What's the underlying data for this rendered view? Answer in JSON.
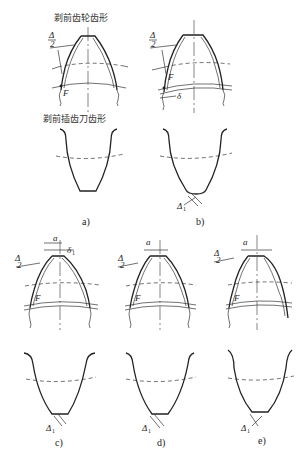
{
  "labels": {
    "gear_profile_title": "剃前齿轮齿形",
    "cutter_profile_title": "剃前插齿刀齿形"
  },
  "symbols": {
    "delta_half_num": "Δ",
    "delta_half_den": "2",
    "F": "F",
    "delta": "δ",
    "a": "a",
    "delta1": "δ",
    "delta1_sub": "1",
    "Delta1": "Δ",
    "Delta1_sub": "1"
  },
  "panels": [
    {
      "id": "a",
      "caption": "a)"
    },
    {
      "id": "b",
      "caption": "b)"
    },
    {
      "id": "c",
      "caption": "c)"
    },
    {
      "id": "d",
      "caption": "d)"
    },
    {
      "id": "e",
      "caption": "e)"
    }
  ]
}
